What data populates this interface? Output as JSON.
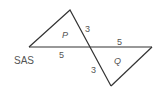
{
  "diagram": {
    "caption": "SAS",
    "stroke_color": "#333333",
    "text_color": "#555555",
    "triangles": [
      {
        "name": "P",
        "vertices": [
          [
            29,
            47
          ],
          [
            70,
            10
          ],
          [
            90,
            47
          ]
        ],
        "label_pos": [
          62,
          38
        ]
      },
      {
        "name": "Q",
        "vertices": [
          [
            90,
            47
          ],
          [
            152,
            47
          ],
          [
            111,
            86
          ]
        ],
        "label_pos": [
          114,
          64
        ]
      }
    ],
    "side_labels": [
      {
        "text": "3",
        "side": "P upper slanted side",
        "pos": [
          85,
          32
        ]
      },
      {
        "text": "5",
        "side": "P horizontal side",
        "pos": [
          59,
          58
        ]
      },
      {
        "text": "5",
        "side": "Q horizontal side",
        "pos": [
          117,
          45
        ]
      },
      {
        "text": "3",
        "side": "Q lower slanted side",
        "pos": [
          91,
          73
        ]
      }
    ]
  }
}
